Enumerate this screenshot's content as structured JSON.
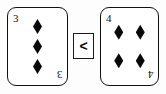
{
  "scene": {
    "background_color": "#fdfdfd",
    "ink_color": "#0c0c0c",
    "description": "Two playing cards separated by a comparison operator box"
  },
  "left_card": {
    "rank": "3",
    "rank_corner_top_left": "3",
    "rank_corner_bottom_right": "3",
    "suit": "diamonds",
    "suit_symbol": "♦",
    "suit_color": "#080808",
    "pip_count": 3,
    "pip_layout": "single-column",
    "pips": [
      "♦",
      "♦",
      "♦"
    ]
  },
  "comparison": {
    "operator": "<",
    "operator_name": "less-than",
    "border_color": "#1a1a1a"
  },
  "right_card": {
    "rank": "4",
    "rank_corner_top_left": "4",
    "rank_corner_bottom_right": "4",
    "suit": "diamonds",
    "suit_symbol": "♦",
    "suit_color": "#080808",
    "pip_count": 4,
    "pip_layout": "two-by-two-grid",
    "pips": [
      "♦",
      "♦",
      "♦",
      "♦"
    ]
  }
}
